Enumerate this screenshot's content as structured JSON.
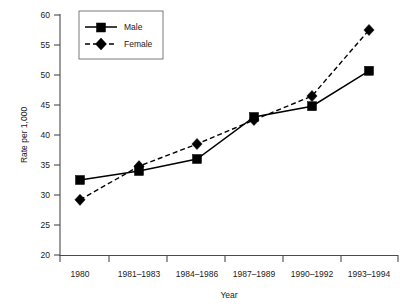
{
  "chart_data": {
    "type": "line",
    "title": "",
    "xlabel": "Year",
    "ylabel": "Rate per 1,000",
    "categories": [
      "1980",
      "1981–1983",
      "1984–1986",
      "1987–1989",
      "1990–1992",
      "1993–1994"
    ],
    "ylim": [
      20,
      60
    ],
    "yticks": [
      20,
      25,
      30,
      35,
      40,
      45,
      50,
      55,
      60
    ],
    "ytick_labels": [
      "20",
      "25",
      "30",
      "35",
      "40",
      "45",
      "50",
      "55",
      "60"
    ],
    "grid": false,
    "legend_position": "top-left",
    "series": [
      {
        "name": "Male",
        "marker": "square",
        "linestyle": "solid",
        "color": "#000000",
        "values": [
          32.5,
          34.0,
          36.0,
          43.0,
          44.8,
          50.7
        ]
      },
      {
        "name": "Female",
        "marker": "diamond",
        "linestyle": "dashed",
        "color": "#000000",
        "values": [
          29.2,
          34.8,
          38.5,
          42.5,
          46.5,
          57.5
        ]
      }
    ]
  },
  "legend": {
    "entries": [
      {
        "label": "Male"
      },
      {
        "label": "Female"
      }
    ]
  },
  "axes": {
    "y_title": "Rate per 1,000",
    "x_title": "Year"
  }
}
